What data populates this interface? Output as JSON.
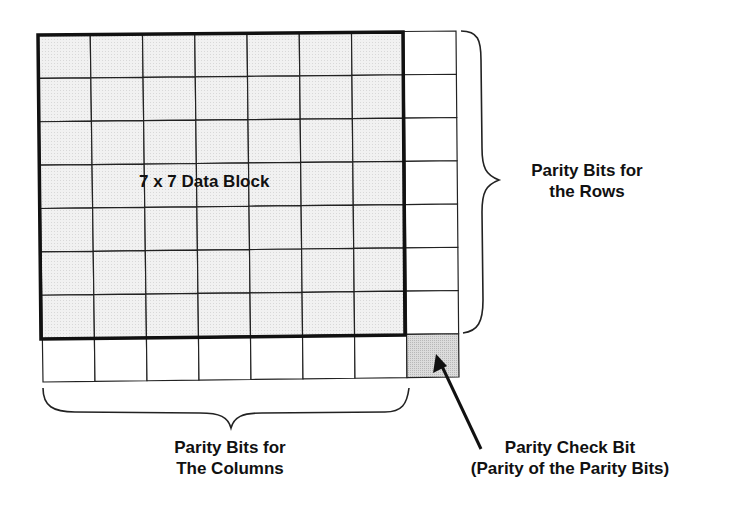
{
  "diagram": {
    "grid": {
      "rows": 7,
      "cols": 7,
      "data_fill": "#eeeeee",
      "parity_fill": "#ffffff",
      "check_bit_fill": "#d6d6d6",
      "line_color": "#222222"
    },
    "labels": {
      "data_block": "7 x 7 Data Block",
      "row_parity_line1": "Parity Bits for",
      "row_parity_line2": "the Rows",
      "col_parity_line1": "Parity Bits for",
      "col_parity_line2": "The Columns",
      "check_bit_line1": "Parity Check Bit",
      "check_bit_line2": "(Parity of the Parity Bits)"
    }
  }
}
